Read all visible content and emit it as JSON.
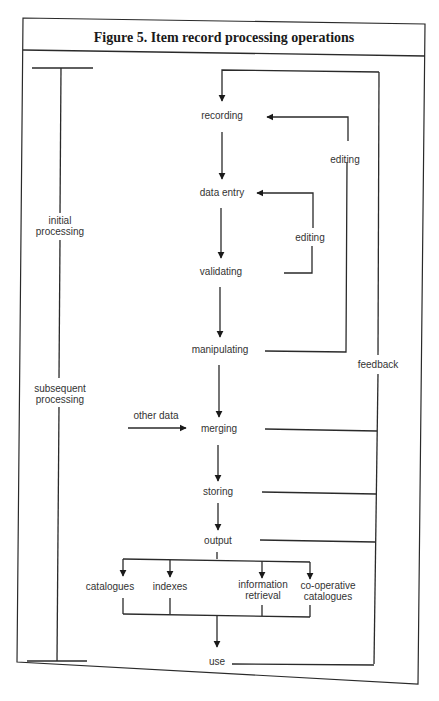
{
  "figure": {
    "title": "Figure 5.  Item record processing operations"
  },
  "phases": {
    "initial": [
      "initial",
      "processing"
    ],
    "subsequent": [
      "subsequent",
      "processing"
    ]
  },
  "steps": {
    "recording": "recording",
    "data_entry": "data entry",
    "validating": "validating",
    "manipulating": "manipulating",
    "merging": "merging",
    "storing": "storing",
    "output": "output",
    "use": "use"
  },
  "loops": {
    "editing_outer": "editing",
    "editing_inner": "editing",
    "feedback": "feedback"
  },
  "inputs": {
    "other_data": "other data"
  },
  "outputs": [
    {
      "lines": [
        "catalogues"
      ]
    },
    {
      "lines": [
        "indexes"
      ]
    },
    {
      "lines": [
        "information",
        "retrieval"
      ]
    },
    {
      "lines": [
        "co-operative",
        "catalogues"
      ]
    }
  ],
  "colors": {
    "line": "#2a2a2a",
    "text": "#333333",
    "background": "#ffffff"
  }
}
